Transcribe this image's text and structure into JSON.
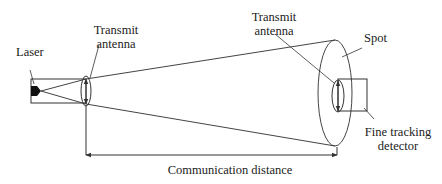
{
  "labels": {
    "laser": "Laser",
    "transmit_antenna_left_line1": "Transmit",
    "transmit_antenna_left_line2": "antenna",
    "transmit_antenna_right_line1": "Transmit",
    "transmit_antenna_right_line2": "antenna",
    "spot": "Spot",
    "fine_tracking_line1": "Fine tracking",
    "fine_tracking_line2": "detector",
    "communication_distance": "Communication distance"
  },
  "colors": {
    "stroke": "#333333",
    "text": "#222222",
    "background": "#ffffff"
  }
}
